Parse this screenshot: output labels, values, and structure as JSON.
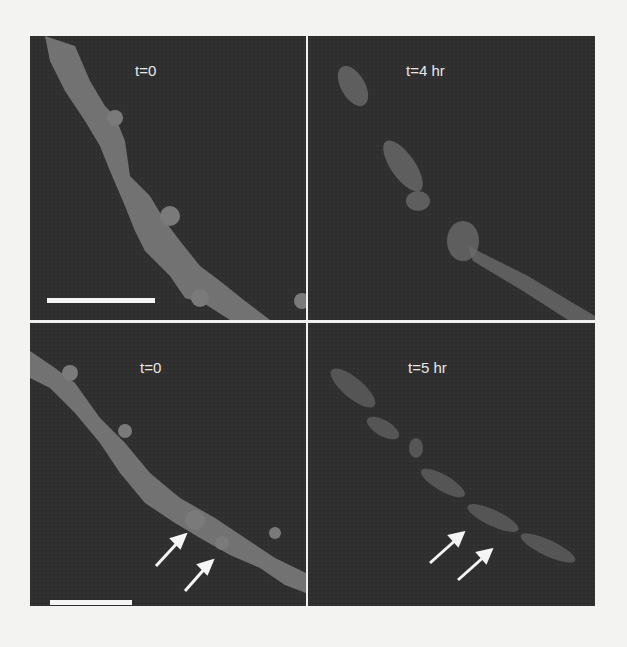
{
  "figure": {
    "panels": [
      {
        "id": "top-left",
        "label": "t=0",
        "has_scale_bar": true,
        "arrows": 0
      },
      {
        "id": "top-right",
        "label": "t=4 hr",
        "has_scale_bar": false,
        "arrows": 0
      },
      {
        "id": "bottom-left",
        "label": "t=0",
        "has_scale_bar": true,
        "arrows": 2
      },
      {
        "id": "bottom-right",
        "label": "t=5 hr",
        "has_scale_bar": false,
        "arrows": 2
      }
    ],
    "colors": {
      "background": "#2e2e2e",
      "dendrite": "#7a7a7a",
      "label": "#e8e8e8",
      "divider": "#f0f0f0"
    }
  }
}
